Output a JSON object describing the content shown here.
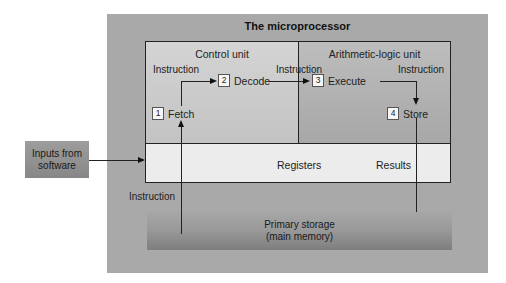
{
  "diagram": {
    "title": "The microprocessor",
    "sections": {
      "control_unit": {
        "label": "Control unit"
      },
      "alu": {
        "label": "Arithmetic-logic unit"
      },
      "registers": {
        "label": "Registers",
        "results_label": "Results"
      }
    },
    "steps": [
      {
        "number": "1",
        "label": "Fetch"
      },
      {
        "number": "2",
        "label": "Decode"
      },
      {
        "number": "3",
        "label": "Execute"
      },
      {
        "number": "4",
        "label": "Store"
      }
    ],
    "flow_labels": {
      "fetch_to_decode": "Instruction",
      "decode_to_execute": "Instruction",
      "execute_to_store": "Instruction",
      "storage_to_fetch": "Instruction"
    },
    "inputs": {
      "line1": "Inputs from",
      "line2": "software"
    },
    "primary_storage": {
      "line1": "Primary storage",
      "line2": "(main memory)"
    },
    "colors": {
      "outer_panel": "#a9a9a9",
      "control_unit": "#cccccc",
      "alu": "#b2b2b2",
      "registers": "#ececec",
      "line": "#222222"
    }
  }
}
